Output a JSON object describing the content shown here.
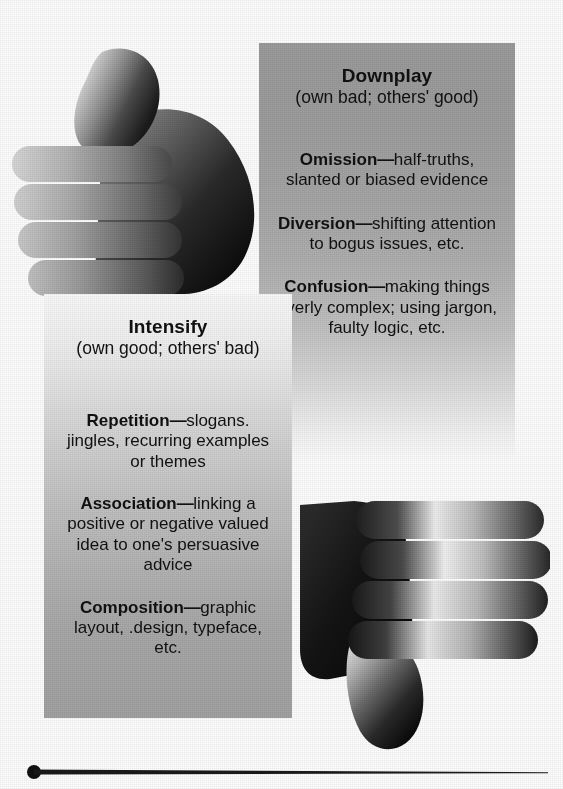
{
  "figure": {
    "panels": [
      {
        "id": "downplay",
        "heading": "Downplay",
        "subheading": "(own bad; others' good)",
        "icon": "thumbs-down-icon",
        "entries": [
          {
            "term": "Omission",
            "dash": "—",
            "text": "half-truths, slanted or biased evidence"
          },
          {
            "term": "Diversion",
            "dash": "—",
            "text": "shifting attention to bogus issues, etc."
          },
          {
            "term": "Confusion",
            "dash": "—",
            "text": "making things overly complex; using jargon, faulty logic, etc."
          }
        ]
      },
      {
        "id": "intensify",
        "heading": "Intensify",
        "subheading": "(own good; others' bad)",
        "icon": "thumbs-up-icon",
        "entries": [
          {
            "term": "Repetition",
            "dash": "—",
            "text": "slogans. jingles, recurring examples or themes"
          },
          {
            "term": "Association",
            "dash": "—",
            "text": "linking a positive or negative valued idea to one's persuasive advice"
          },
          {
            "term": "Composition",
            "dash": "—",
            "text": "graphic layout, .design, typeface, etc."
          }
        ]
      }
    ],
    "decoration": {
      "bottom_rule": "tapered-rule-with-dot"
    },
    "colors": {
      "text": "#111111",
      "downplay_panel_top": "#9c9c9c",
      "downplay_panel_bottom": "#ffffff",
      "intensify_panel_top": "#fbfbfb",
      "intensify_panel_bottom": "#a3a3a3",
      "rule": "#1a1a1a"
    }
  }
}
